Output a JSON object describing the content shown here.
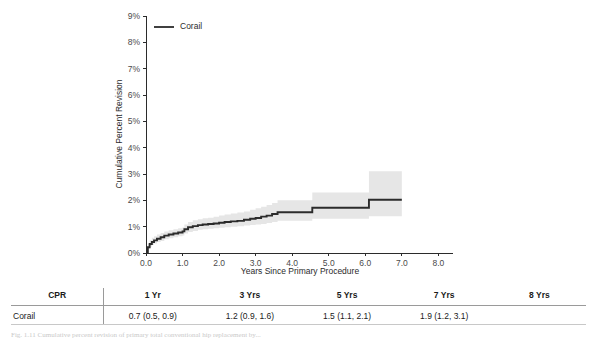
{
  "chart_data": {
    "type": "line",
    "title": "",
    "xlabel": "Years Since Primary Procedure",
    "ylabel": "Cumulative Percent Revision",
    "xlim": [
      0.0,
      8.4
    ],
    "ylim": [
      0,
      9
    ],
    "grid": false,
    "legend_position": "top-left",
    "xticks": [
      "0.0",
      "1.0",
      "2.0",
      "3.0",
      "4.0",
      "5.0",
      "6.0",
      "7.0",
      "8.0"
    ],
    "xtick_values": [
      0,
      1,
      2,
      3,
      4,
      5,
      6,
      7,
      8
    ],
    "yticks": [
      "0%",
      "1%",
      "2%",
      "3%",
      "4%",
      "5%",
      "6%",
      "7%",
      "8%",
      "9%"
    ],
    "ytick_values": [
      0,
      1,
      2,
      3,
      4,
      5,
      6,
      7,
      8,
      9
    ],
    "series": [
      {
        "name": "Corail",
        "color": "#2b2b2b",
        "band_color": "#e6e6e6",
        "x": [
          0.0,
          0.05,
          0.1,
          0.16,
          0.22,
          0.3,
          0.4,
          0.5,
          0.62,
          0.75,
          0.88,
          1.0,
          1.05,
          1.15,
          1.28,
          1.42,
          1.55,
          1.7,
          1.85,
          2.0,
          2.15,
          2.32,
          2.5,
          2.68,
          2.85,
          3.0,
          3.15,
          3.3,
          3.45,
          3.6,
          4.55,
          6.1,
          7.0
        ],
        "y": [
          0.0,
          0.22,
          0.34,
          0.42,
          0.48,
          0.54,
          0.6,
          0.66,
          0.7,
          0.74,
          0.78,
          0.82,
          0.9,
          0.98,
          1.02,
          1.06,
          1.08,
          1.1,
          1.12,
          1.15,
          1.18,
          1.2,
          1.22,
          1.26,
          1.3,
          1.33,
          1.38,
          1.42,
          1.48,
          1.55,
          1.72,
          2.02,
          2.02
        ],
        "ci_lower": [
          0.0,
          0.14,
          0.24,
          0.3,
          0.36,
          0.42,
          0.46,
          0.52,
          0.56,
          0.6,
          0.64,
          0.66,
          0.74,
          0.8,
          0.84,
          0.88,
          0.9,
          0.92,
          0.94,
          0.96,
          0.98,
          1.0,
          1.02,
          1.04,
          1.06,
          1.08,
          1.1,
          1.14,
          1.18,
          1.22,
          1.3,
          1.4,
          1.4
        ],
        "ci_upper": [
          0.0,
          0.34,
          0.48,
          0.58,
          0.64,
          0.7,
          0.76,
          0.82,
          0.86,
          0.9,
          0.94,
          0.98,
          1.08,
          1.18,
          1.24,
          1.28,
          1.32,
          1.34,
          1.38,
          1.42,
          1.46,
          1.5,
          1.54,
          1.58,
          1.64,
          1.7,
          1.76,
          1.82,
          1.9,
          2.0,
          2.3,
          3.1,
          3.1
        ]
      }
    ],
    "legend": [
      {
        "label": "Corail",
        "color": "#2b2b2b"
      }
    ]
  },
  "legend": {
    "entry_label": "Corail"
  },
  "axes": {
    "y_title": "Cumulative Percent Revision",
    "x_title": "Years Since Primary Procedure"
  },
  "table": {
    "headers": [
      "CPR",
      "1 Yr",
      "3 Yrs",
      "5 Yrs",
      "7 Yrs",
      "8 Yrs"
    ],
    "rows": [
      {
        "label": "Corail",
        "values": [
          "0.7 (0.5, 0.9)",
          "1.2 (0.9, 1.6)",
          "1.5 (1.1, 2.1)",
          "1.9 (1.2, 3.1)",
          ""
        ]
      }
    ]
  },
  "caption": {
    "text": "Fig. 1.11  Cumulative percent revision of primary total conventional hip replacement by..."
  }
}
